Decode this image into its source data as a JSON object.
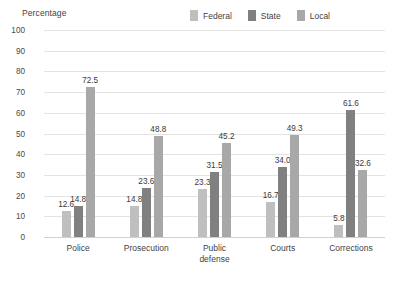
{
  "chart_data": {
    "type": "bar",
    "title": "",
    "ylabel": "Percentage",
    "xlabel": "",
    "ylim": [
      0,
      100
    ],
    "ytick_step": 10,
    "yticks": [
      "100",
      "90",
      "80",
      "70",
      "60",
      "50",
      "40",
      "30",
      "20",
      "10",
      "0"
    ],
    "grid": true,
    "legend_position": "top-right",
    "categories": [
      "Police",
      "Prosecution",
      "Public defense",
      "Courts",
      "Corrections"
    ],
    "category_lines": [
      [
        "Police"
      ],
      [
        "Prosecution"
      ],
      [
        "Public",
        "defense"
      ],
      [
        "Courts"
      ],
      [
        "Corrections"
      ]
    ],
    "series": [
      {
        "name": "Federal",
        "color": "#bfbfbf",
        "values": [
          12.6,
          14.8,
          23.3,
          16.7,
          5.8
        ],
        "labels": [
          "12.6",
          "14.8",
          "23.3",
          "16.7",
          "5.8"
        ]
      },
      {
        "name": "State",
        "color": "#808080",
        "values": [
          14.8,
          23.6,
          31.5,
          34.0,
          61.6
        ],
        "labels": [
          "14.8",
          "23.6",
          "31.5",
          "34.0",
          "61.6"
        ]
      },
      {
        "name": "Local",
        "color": "#a8a8a8",
        "values": [
          72.5,
          48.8,
          45.2,
          49.3,
          32.6
        ],
        "labels": [
          "72.5",
          "48.8",
          "45.2",
          "49.3",
          "32.6"
        ]
      }
    ]
  },
  "colors": {
    "federal": "#bfbfbf",
    "state": "#808080",
    "local": "#a8a8a8",
    "gridline": "#e3e3e3",
    "baseline": "#cfcfcf",
    "text": "#3f3f3f",
    "background": "#ffffff"
  }
}
